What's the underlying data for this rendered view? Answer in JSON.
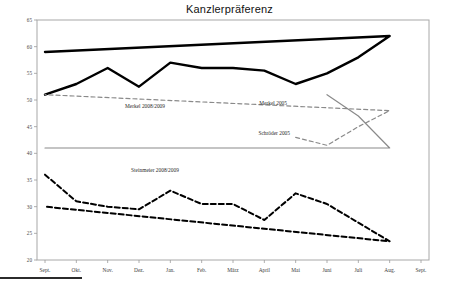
{
  "chart_title": "Kanzlerpräferenz",
  "axis": {
    "y_tick_labels": [
      "65",
      "60",
      "55",
      "50",
      "45",
      "40",
      "35",
      "30",
      "25",
      "20"
    ],
    "x_tick_labels": [
      "Sept.",
      "Okt.",
      "Nov.",
      "Dez.",
      "Jan.",
      "Feb.",
      "März",
      "April",
      "Mai",
      "Juni",
      "Juli",
      "Aug.",
      "Sept."
    ]
  },
  "annotations": {
    "merkel_0809": "Merkel 2008/2009",
    "steinmeier_0809": "Steinmeier 2008/2009",
    "merkel_2005": "Merkel 2005",
    "schroeder_2005": "Schröder 2005"
  },
  "colors": {
    "merkel_0809": "#000000",
    "steinmeier_0809": "#000000",
    "merkel_2005": "#8a8a8a",
    "schroeder_2005": "#8a8a8a",
    "axis": "#9a9a9a",
    "background": "#ffffff"
  },
  "chart_data": {
    "type": "line",
    "title": "Kanzlerpräferenz",
    "xlabel": "",
    "ylabel": "",
    "ylim": [
      20,
      65
    ],
    "ytick_step": 5,
    "grid": false,
    "legend": "inline-annotations",
    "categories": [
      "Sept.",
      "Okt.",
      "Nov.",
      "Dez.",
      "Jan.",
      "Feb.",
      "März",
      "April",
      "Mai",
      "Juni",
      "Juli",
      "Aug.",
      "Sept."
    ],
    "series": [
      {
        "name": "Merkel 2008/2009",
        "style": "solid-thick",
        "color": "#000000",
        "x": [
          "Sept.",
          "Okt.",
          "Nov.",
          "Dez.",
          "Jan.",
          "Feb.",
          "März",
          "April",
          "Mai",
          "Juni",
          "Juli",
          "Aug.",
          "Sept."
        ],
        "values": [
          51,
          53,
          56,
          52.5,
          57,
          56,
          56,
          55.5,
          53,
          55,
          58,
          62,
          59
        ]
      },
      {
        "name": "Steinmeier 2008/2009",
        "style": "dashed",
        "color": "#000000",
        "x": [
          "Sept.",
          "Okt.",
          "Nov.",
          "Dez.",
          "Jan.",
          "Feb.",
          "März",
          "April",
          "Mai",
          "Juni",
          "Juli",
          "Aug.",
          "Sept."
        ],
        "values": [
          36,
          31,
          30,
          29.5,
          33,
          30.5,
          30.5,
          27.5,
          32.5,
          30.5,
          27,
          23.5,
          30
        ]
      },
      {
        "name": "Merkel 2005",
        "style": "solid-thin",
        "color": "#8a8a8a",
        "x": [
          "Juni",
          "Juli",
          "Aug.",
          "Sept."
        ],
        "values": [
          51,
          47,
          41,
          41
        ]
      },
      {
        "name": "Schröder 2005",
        "style": "dashed-thin",
        "color": "#8a8a8a",
        "x": [
          "Mai",
          "Juni",
          "Juli",
          "Aug.",
          "Sept."
        ],
        "values": [
          43,
          41.5,
          45,
          48,
          51
        ]
      }
    ]
  }
}
